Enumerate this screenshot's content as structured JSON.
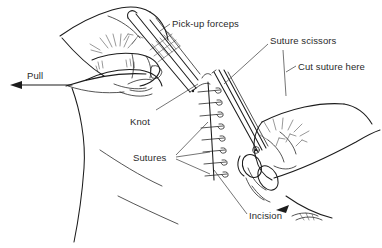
{
  "figure": {
    "background_color": "#ffffff",
    "ink_color": "#1c1c1c",
    "text_color": "#2a2a2a"
  },
  "labels": {
    "pull": "Pull",
    "pickup_forceps": "Pick-up forceps",
    "suture_scissors": "Suture scissors",
    "cut_suture_here": "Cut suture here",
    "knot": "Knot",
    "sutures": "Sutures",
    "incision": "Incision"
  },
  "elements": {
    "stitch_count": 8,
    "direction_arrow": "left-arrow",
    "instruments": [
      "pick-up-forceps",
      "suture-scissors"
    ],
    "hands": [
      "left-hand-holding-forceps",
      "right-hand-holding-scissors"
    ]
  }
}
